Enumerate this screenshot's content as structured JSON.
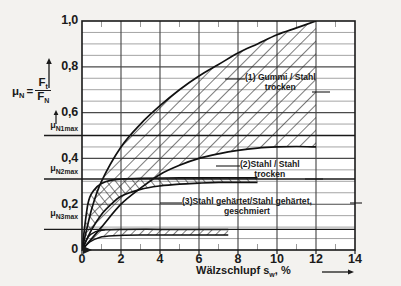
{
  "chart_data": {
    "type": "line",
    "title": "",
    "xlabel": "Wälzschlupf s_w, %",
    "ylabel": "μ_N = F_t / F_N",
    "xlim": [
      0,
      14
    ],
    "ylim": [
      0,
      1.0
    ],
    "grid": true,
    "x_ticks": [
      0,
      2,
      4,
      6,
      8,
      10,
      12,
      14
    ],
    "x_tick_labels": [
      "0",
      "2",
      "4",
      "6",
      "8",
      "10",
      "12",
      "14"
    ],
    "y_ticks": [
      0,
      0.2,
      0.4,
      0.6,
      0.8,
      1.0
    ],
    "y_tick_labels": [
      "0",
      "0,2",
      "0,4",
      "0,6",
      "0,8",
      "1,0"
    ],
    "y_minor_step": 0.05,
    "x_minor_step": 1,
    "legend_position": "inline-annotations",
    "reference_lines": [
      {
        "name": "μN1max",
        "value": 0.5,
        "label": "μ",
        "sub": "N1max"
      },
      {
        "name": "μN2max",
        "value": 0.31,
        "label": "μ",
        "sub": "N2max"
      },
      {
        "name": "μN3max",
        "value": 0.09,
        "label": "μ",
        "sub": "N3max"
      }
    ],
    "bands": [
      {
        "id": 1,
        "label_line1": "(1) Gummi / Stahl",
        "label_line2": "trocken",
        "hatched": true,
        "upper": [
          [
            0,
            0
          ],
          [
            0.5,
            0.18
          ],
          [
            1,
            0.3
          ],
          [
            2,
            0.45
          ],
          [
            3,
            0.55
          ],
          [
            4,
            0.63
          ],
          [
            5,
            0.7
          ],
          [
            6,
            0.76
          ],
          [
            7,
            0.81
          ],
          [
            8,
            0.86
          ],
          [
            9,
            0.9
          ],
          [
            10,
            0.94
          ],
          [
            11,
            0.97
          ],
          [
            12,
            1.0
          ]
        ],
        "lower": [
          [
            0,
            0
          ],
          [
            1,
            0.1
          ],
          [
            2,
            0.2
          ],
          [
            3,
            0.27
          ],
          [
            4,
            0.33
          ],
          [
            5,
            0.37
          ],
          [
            6,
            0.4
          ],
          [
            7,
            0.42
          ],
          [
            8,
            0.435
          ],
          [
            9,
            0.445
          ],
          [
            10,
            0.45
          ],
          [
            11,
            0.452
          ],
          [
            12,
            0.45
          ]
        ]
      },
      {
        "id": 2,
        "label_line1": "(2)Stahl / Stahl",
        "label_line2": "trocken",
        "hatched": true,
        "upper": [
          [
            0,
            0
          ],
          [
            0.3,
            0.2
          ],
          [
            0.6,
            0.26
          ],
          [
            1,
            0.29
          ],
          [
            1.5,
            0.305
          ],
          [
            2,
            0.31
          ],
          [
            3,
            0.313
          ],
          [
            5,
            0.315
          ],
          [
            7,
            0.315
          ],
          [
            9,
            0.315
          ]
        ],
        "lower": [
          [
            0,
            0
          ],
          [
            0.5,
            0.09
          ],
          [
            1,
            0.155
          ],
          [
            1.5,
            0.2
          ],
          [
            2,
            0.235
          ],
          [
            3,
            0.265
          ],
          [
            4,
            0.28
          ],
          [
            5,
            0.288
          ],
          [
            6,
            0.292
          ],
          [
            7,
            0.295
          ],
          [
            8,
            0.295
          ],
          [
            9,
            0.295
          ]
        ]
      },
      {
        "id": 3,
        "label_line1": "(3)Stahl gehärtet/Stahl gehärtet,",
        "label_line2": "geschmiert",
        "hatched": true,
        "upper": [
          [
            0,
            0
          ],
          [
            0.3,
            0.055
          ],
          [
            0.7,
            0.08
          ],
          [
            1.2,
            0.088
          ],
          [
            2,
            0.09
          ],
          [
            4,
            0.09
          ],
          [
            6,
            0.09
          ],
          [
            7.5,
            0.09
          ]
        ],
        "lower": [
          [
            0,
            0
          ],
          [
            0.4,
            0.035
          ],
          [
            0.9,
            0.055
          ],
          [
            1.6,
            0.062
          ],
          [
            3,
            0.065
          ],
          [
            5,
            0.065
          ],
          [
            7.5,
            0.065
          ]
        ]
      }
    ]
  },
  "axes": {
    "y_label_mu": "μ",
    "y_label_mu_sub": "N",
    "y_label_eq": "=",
    "y_label_num": "F",
    "y_label_num_sub": "t",
    "y_label_den": "F",
    "y_label_den_sub": "N",
    "x_label_main": "Wälzschlupf s",
    "x_label_sub": "w",
    "x_label_unit": ", %"
  }
}
